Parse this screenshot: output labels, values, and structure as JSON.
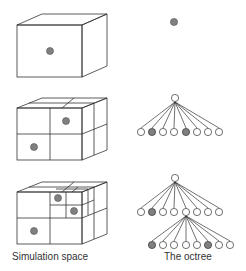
{
  "labels": {
    "simulation_space": "Simulation space",
    "octree": "The octree"
  },
  "colors": {
    "line": "#333333",
    "filled_node": "#808080",
    "empty_node": "#ffffff",
    "background": "#ffffff"
  },
  "rows": [
    {
      "level": 0,
      "description": "Single cube containing one particle; tree is a single filled node"
    },
    {
      "level": 1,
      "description": "Cube split into 8 octants; 2 octants contain particles; root with 8 children, children 2 and 5 filled"
    },
    {
      "level": 2,
      "description": "One octant further subdivided; root with 8 children (child 2 filled), child 5 has 8 children (children 1 and 6 filled)"
    }
  ]
}
